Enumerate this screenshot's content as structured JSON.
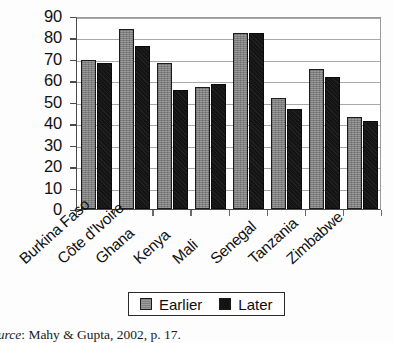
{
  "chart_data": {
    "type": "bar",
    "title": "",
    "subtitle": "",
    "xlabel": "",
    "ylabel": "",
    "ylim": [
      0,
      90
    ],
    "ytick_step": 10,
    "yticks": [
      0,
      10,
      20,
      30,
      40,
      50,
      60,
      70,
      80,
      90
    ],
    "grid": true,
    "grid_axis": "y",
    "legend_position": "bottom-center",
    "categories": [
      "Burkina Faso",
      "Côte d'Ivoire",
      "Ghana",
      "Kenya",
      "Mali",
      "Senegal",
      "Tanzania",
      "Zimbabwe"
    ],
    "series": [
      {
        "name": "Earlier",
        "color": "#808080",
        "values": [
          69.5,
          84,
          68,
          57,
          82,
          52,
          65.5,
          43
        ]
      },
      {
        "name": "Later",
        "color": "#141414",
        "values": [
          68,
          76,
          55.5,
          58.5,
          82,
          46.5,
          61.5,
          41
        ]
      }
    ]
  },
  "legend": {
    "entries": [
      {
        "label": "Earlier",
        "swatch": "earlier"
      },
      {
        "label": "Later",
        "swatch": "later"
      }
    ]
  },
  "caption": {
    "source_word": "ource",
    "source_text": ": Mahy & Gupta, 2002, p. 17."
  },
  "colors": {
    "earlier_bar": "#808080",
    "later_bar": "#141414",
    "axis": "#4a4a4a",
    "gridline": "#a8a8a8",
    "plot_background": "#ffffff",
    "page_background": "#fdfdfd"
  }
}
